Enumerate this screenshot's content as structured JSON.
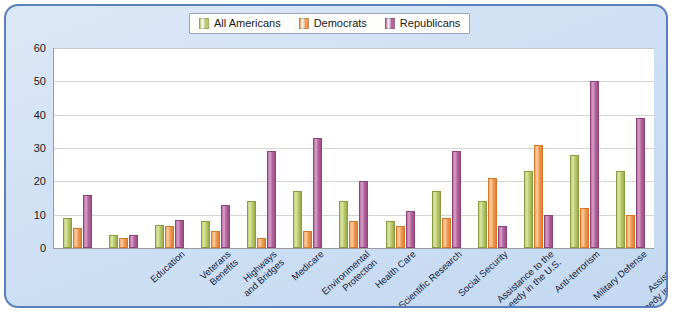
{
  "chart_data": {
    "type": "bar",
    "title": "",
    "xlabel": "",
    "ylabel": "",
    "ylim": [
      0,
      60
    ],
    "yticks": [
      0,
      10,
      20,
      30,
      40,
      50,
      60
    ],
    "grid": true,
    "legend_position": "top-center",
    "categories": [
      "Education",
      "Veterans\nBenefits",
      "Highways\nand Bridges",
      "Medicare",
      "Environmental\nProtection",
      "Health Care",
      "Scientific Research",
      "Social Security",
      "Assistance to the\nneedy in the U.S.",
      "Anti-terrorism",
      "Military Defense",
      "Assistance to\nneedy in the world",
      "Assistance to\nthe unemployed"
    ],
    "series": [
      {
        "name": "All Americans",
        "color": "#b9c96a",
        "values": [
          9,
          4,
          7,
          8,
          14,
          17,
          14,
          8,
          17,
          14,
          23,
          28,
          23
        ]
      },
      {
        "name": "Democrats",
        "color": "#f09a53",
        "values": [
          6,
          3,
          6.5,
          5,
          3,
          5,
          8,
          6.5,
          9,
          21,
          31,
          12,
          10
        ]
      },
      {
        "name": "Republicans",
        "color": "#b2649c",
        "values": [
          16,
          4,
          8.5,
          13,
          29,
          33,
          20,
          11,
          29,
          6.5,
          10,
          50,
          39
        ]
      }
    ]
  },
  "frame": {
    "border_color": "#5b7fbe",
    "background_color": "#cfe0f4",
    "plot_background_color": "#ffffff"
  }
}
